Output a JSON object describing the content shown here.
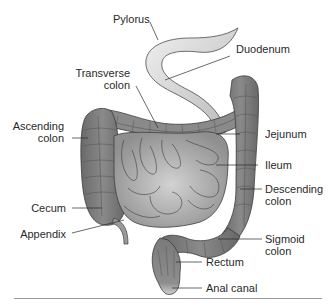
{
  "diagram": {
    "colors": {
      "background": "#ffffff",
      "colon": "#7d7d7d",
      "colon_dark": "#5e5e5e",
      "small_intestine": "#a9a9a9",
      "stomach_light": "#e4e4e4",
      "outline": "#3c3c3c",
      "leader_line": "#2a2a2a",
      "label_text": "#2a2a2a",
      "divider": "#9a9a9a"
    },
    "labels": {
      "pylorus": "Pylorus",
      "duodenum": "Duodenum",
      "transverse_colon_1": "Transverse",
      "transverse_colon_2": "colon",
      "ascending_colon_1": "Ascending",
      "ascending_colon_2": "colon",
      "jejunum": "Jejunum",
      "ileum": "Ileum",
      "descending_colon_1": "Descending",
      "descending_colon_2": "colon",
      "cecum": "Cecum",
      "appendix": "Appendix",
      "sigmoid_colon_1": "Sigmoid",
      "sigmoid_colon_2": "colon",
      "rectum": "Rectum",
      "anal_canal": "Anal canal"
    }
  }
}
